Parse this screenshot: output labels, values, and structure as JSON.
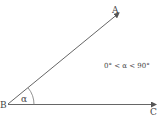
{
  "diagram": {
    "type": "angle",
    "points": {
      "A": {
        "label": "A",
        "x": 120,
        "y": 12
      },
      "B": {
        "label": "B",
        "x": 8,
        "y": 104
      },
      "C": {
        "label": "C",
        "x": 157,
        "y": 105
      }
    },
    "angle_label": "α",
    "condition": "0° < α < 90°",
    "line_color": "#555555"
  }
}
